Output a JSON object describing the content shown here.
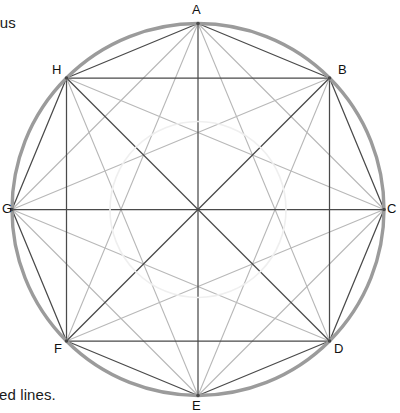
{
  "figure": {
    "title_fragment_top_left": "dius",
    "caption_fragment_bottom_left": "red lines.",
    "background_color": "#ffffff",
    "circle": {
      "center_x": 198,
      "center_y": 209.5,
      "radius": 186,
      "stroke_color": "#9b9b9b",
      "stroke_width": 3.4,
      "fill": "none"
    },
    "inner_arc_artifact": {
      "center_x": 198,
      "center_y": 209.5,
      "radius": 88,
      "stroke_color": "#efefef",
      "stroke_width": 1.6
    },
    "vertices": [
      {
        "id": "A",
        "label": "A",
        "x": 198,
        "y": 23.5,
        "label_x": 192,
        "label_y": 2,
        "angle_deg": 90
      },
      {
        "id": "B",
        "label": "B",
        "x": 329.5,
        "y": 78,
        "label_x": 338,
        "label_y": 62,
        "angle_deg": 45
      },
      {
        "id": "C",
        "label": "C",
        "x": 384,
        "y": 209.5,
        "label_x": 387,
        "label_y": 201,
        "angle_deg": 0
      },
      {
        "id": "D",
        "label": "D",
        "x": 329.5,
        "y": 341,
        "label_x": 334,
        "label_y": 341,
        "angle_deg": -45
      },
      {
        "id": "E",
        "label": "E",
        "x": 198,
        "y": 395.5,
        "label_x": 192,
        "label_y": 398,
        "angle_deg": -90
      },
      {
        "id": "F",
        "label": "F",
        "x": 66.5,
        "y": 341,
        "label_x": 54,
        "label_y": 341,
        "angle_deg": -135
      },
      {
        "id": "G",
        "label": "G",
        "x": 12,
        "y": 209.5,
        "label_x": 2,
        "label_y": 201,
        "angle_deg": 180
      },
      {
        "id": "H",
        "label": "H",
        "x": 66.5,
        "y": 78,
        "label_x": 52,
        "label_y": 62,
        "angle_deg": 135
      }
    ],
    "line_styles": {
      "primary_stroke_color": "#4a4a4a",
      "primary_stroke_width": 1.25,
      "secondary_stroke_color": "#b8b8b8",
      "secondary_stroke_width": 1.1
    },
    "primary_edges": [
      [
        "A",
        "B"
      ],
      [
        "B",
        "C"
      ],
      [
        "C",
        "D"
      ],
      [
        "D",
        "E"
      ],
      [
        "E",
        "F"
      ],
      [
        "F",
        "G"
      ],
      [
        "G",
        "H"
      ],
      [
        "H",
        "A"
      ],
      [
        "A",
        "E"
      ],
      [
        "B",
        "F"
      ],
      [
        "C",
        "G"
      ],
      [
        "D",
        "H"
      ],
      [
        "B",
        "D"
      ],
      [
        "D",
        "F"
      ],
      [
        "F",
        "H"
      ],
      [
        "H",
        "B"
      ]
    ],
    "secondary_edges": [
      [
        "A",
        "C"
      ],
      [
        "C",
        "E"
      ],
      [
        "E",
        "G"
      ],
      [
        "G",
        "A"
      ],
      [
        "A",
        "D"
      ],
      [
        "A",
        "F"
      ],
      [
        "B",
        "E"
      ],
      [
        "B",
        "G"
      ],
      [
        "C",
        "F"
      ],
      [
        "C",
        "H"
      ],
      [
        "D",
        "G"
      ],
      [
        "E",
        "H"
      ]
    ]
  }
}
